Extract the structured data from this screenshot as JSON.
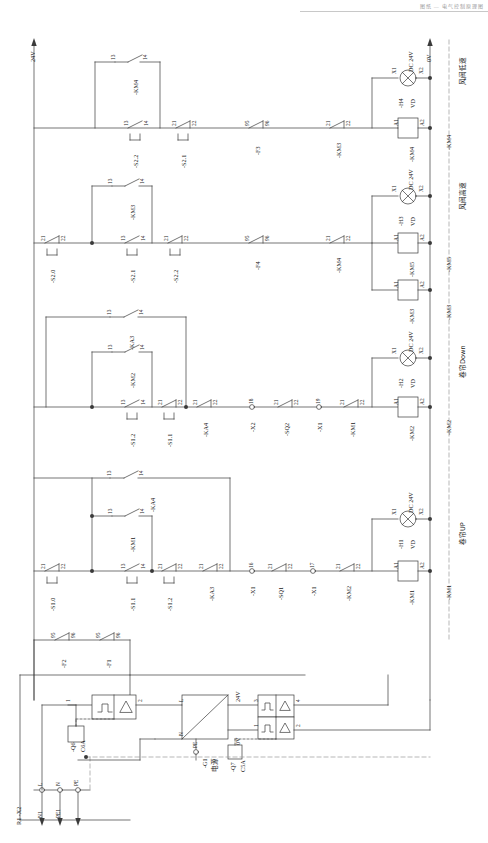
{
  "sheet": {
    "title": "控制电路图",
    "header_note": "图纸  —  电气控制原理图",
    "orientation": "rotated-90",
    "rails": {
      "top_label": "24V",
      "bottom_label": "0V"
    }
  },
  "function_columns": [
    {
      "device": "-KM4",
      "function": "风阀低速"
    },
    {
      "device": "-KM5",
      "function": "风阀高速"
    },
    {
      "device": "-KM3",
      "function": ""
    },
    {
      "device": "-KM2",
      "function": "卷帘Down"
    },
    {
      "device": "-KM1",
      "function": "卷帘UP"
    }
  ],
  "rungs": [
    {
      "name": "rung-km4",
      "coil": {
        "tag": "-KM4",
        "t1": "A1",
        "t2": "A2"
      },
      "lamp": {
        "tag": "-H4",
        "t1": "X1",
        "t2": "X2",
        "spec": "DC 24V",
        "diode": "VD"
      },
      "branch_seal": {
        "tag": "-KM4",
        "t1": "13",
        "t2": "14"
      },
      "contacts": [
        {
          "tag": "-S2.2",
          "t1": "13",
          "t2": "14",
          "type": "no-button"
        },
        {
          "tag": "-S2.1",
          "t1": "21",
          "t2": "22",
          "type": "nc-button"
        },
        {
          "tag": "-F3",
          "t1": "95",
          "t2": "96",
          "type": "nc"
        },
        {
          "tag": "-KM3",
          "t1": "21",
          "t2": "22",
          "type": "nc"
        }
      ]
    },
    {
      "name": "rung-km5",
      "coil": {
        "tag": "-KM5",
        "t1": "A1",
        "t2": "A2"
      },
      "lamp": {
        "tag": "-H3",
        "t1": "X1",
        "t2": "X2",
        "spec": "DC 24V",
        "diode": "VD"
      },
      "coil2": {
        "tag": "-KM3",
        "t1": "A1",
        "t2": "A2"
      },
      "branch_seal": {
        "tag": "-KM3",
        "t1": "13",
        "t2": "14"
      },
      "contacts": [
        {
          "tag": "-S2.0",
          "t1": "21",
          "t2": "22",
          "type": "nc-button"
        },
        {
          "tag": "-S2.1",
          "t1": "13",
          "t2": "14",
          "type": "no-button"
        },
        {
          "tag": "-S2.2",
          "t1": "21",
          "t2": "22",
          "type": "nc-button"
        },
        {
          "tag": "-F4",
          "t1": "95",
          "t2": "96",
          "type": "nc"
        },
        {
          "tag": "-KM4",
          "t1": "21",
          "t2": "22",
          "type": "nc"
        }
      ]
    },
    {
      "name": "rung-km2",
      "coil": {
        "tag": "-KM2",
        "t1": "A1",
        "t2": "A2"
      },
      "lamp": {
        "tag": "-H2",
        "t1": "X1",
        "t2": "X2",
        "spec": "DC 24V",
        "diode": "VD"
      },
      "branch_seal_outer": {
        "tag": "-KA3",
        "t1": "13",
        "t2": "14"
      },
      "branch_seal_inner": {
        "tag": "-KM2",
        "t1": "13",
        "t2": "14"
      },
      "contacts": [
        {
          "tag": "-S1.2",
          "t1": "13",
          "t2": "14",
          "type": "no-button"
        },
        {
          "tag": "-S1.1",
          "t1": "21",
          "t2": "22",
          "type": "nc-button"
        },
        {
          "tag": "-KA4",
          "t1": "21",
          "t2": "22",
          "type": "nc"
        },
        {
          "tag": "-X2",
          "t1": "18",
          "t2": "",
          "type": "terminal"
        },
        {
          "tag": "-SQ2",
          "t1": "21",
          "t2": "22",
          "type": "nc"
        },
        {
          "tag": "-X1",
          "t1": "19",
          "t2": "",
          "type": "terminal"
        },
        {
          "tag": "-KM1",
          "t1": "21",
          "t2": "22",
          "type": "nc"
        }
      ]
    },
    {
      "name": "rung-km1",
      "coil": {
        "tag": "-KM1",
        "t1": "A1",
        "t2": "A2"
      },
      "lamp": {
        "tag": "-H1",
        "t1": "X1",
        "t2": "X2",
        "spec": "DC 24V",
        "diode": "VD"
      },
      "branch_seal_outer": {
        "tag": "-KA4",
        "t1": "13",
        "t2": "14"
      },
      "branch_seal_inner": {
        "tag": "-KM1",
        "t1": "13",
        "t2": "14"
      },
      "contacts": [
        {
          "tag": "-S1.0",
          "t1": "21",
          "t2": "22",
          "type": "nc-button"
        },
        {
          "tag": "-S1.1",
          "t1": "13",
          "t2": "14",
          "type": "no-button"
        },
        {
          "tag": "-S1.2",
          "t1": "21",
          "t2": "22",
          "type": "nc-button"
        },
        {
          "tag": "-KA3",
          "t1": "21",
          "t2": "22",
          "type": "nc"
        },
        {
          "tag": "-X1",
          "t1": "16",
          "t2": "",
          "type": "terminal"
        },
        {
          "tag": "-SQ1",
          "t1": "21",
          "t2": "22",
          "type": "nc"
        },
        {
          "tag": "-X1",
          "t1": "17",
          "t2": "",
          "type": "terminal"
        },
        {
          "tag": "-KM2",
          "t1": "21",
          "t2": "22",
          "type": "nc"
        }
      ]
    }
  ],
  "protection": [
    {
      "tag": "-F2",
      "t1": "95",
      "t2": "96"
    },
    {
      "tag": "-F1",
      "t1": "95",
      "t2": "96"
    }
  ],
  "power": {
    "breaker_main": {
      "tag": "-Q6",
      "rating": "C6A",
      "p1": "1",
      "p2": "2"
    },
    "psu": {
      "tag": "-G1",
      "name": "电源",
      "in_l": "L",
      "in_n": "N",
      "in_pe": "PE",
      "out_pos": "24V",
      "out_neg": "0V"
    },
    "breaker_dc": {
      "tag": "-Q7",
      "rating": "C5A",
      "p1": "1",
      "p2": "2",
      "p3": "3",
      "p4": "4"
    },
    "terminal_block": {
      "tag": "R1  -X2",
      "pins": [
        "L",
        "N",
        "PE"
      ],
      "wires": [
        "N1",
        "PE1"
      ]
    },
    "rail_24v": "24V",
    "rail_0v": "0V"
  }
}
